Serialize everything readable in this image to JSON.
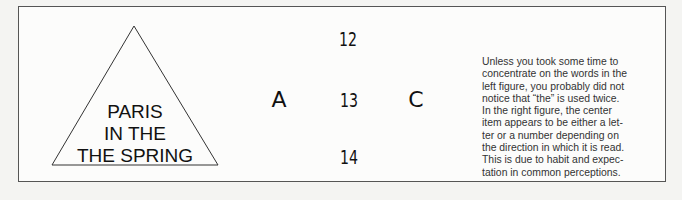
{
  "left_figure": {
    "lines": [
      "PARIS",
      "IN THE",
      "THE SPRING"
    ]
  },
  "right_figure": {
    "top": "12",
    "left": "A",
    "center": "13",
    "right": "C",
    "bottom": "14"
  },
  "caption": {
    "lines": [
      "Unless you took some time to",
      "concentrate on the words in the",
      "left figure, you probably did not",
      "notice that “the” is used twice.",
      "In the right figure, the center",
      "item appears to be either a let-",
      "ter or a number depending on",
      "the direction in which it is read.",
      "This is due to habit and expec-",
      "tation in common perceptions."
    ]
  }
}
